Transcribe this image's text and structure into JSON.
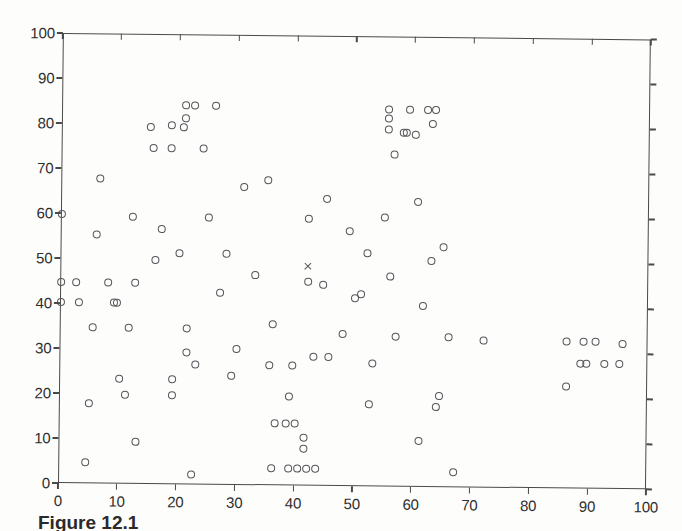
{
  "figure": {
    "caption_fragment": "Figure 12.1"
  },
  "chart_data": {
    "type": "scatter",
    "title": "",
    "subtitle": "",
    "xlabel": "",
    "ylabel": "",
    "xlim": [
      0,
      100
    ],
    "ylim": [
      0,
      100
    ],
    "xticks": [
      0,
      10,
      20,
      30,
      40,
      50,
      60,
      70,
      80,
      90,
      100
    ],
    "yticks": [
      0,
      10,
      20,
      30,
      40,
      50,
      60,
      70,
      80,
      90,
      100
    ],
    "xticklabels": [
      "0",
      "10",
      "20",
      "30",
      "40",
      "50",
      "60",
      "70",
      "80",
      "90",
      "100"
    ],
    "yticklabels": [
      "0",
      "10",
      "20",
      "30",
      "40",
      "50",
      "60",
      "70",
      "80",
      "90",
      "100"
    ],
    "grid": false,
    "legend": null,
    "legend_position": "none",
    "marker_color": "#55555a",
    "axis_color": "#4a4a4a",
    "background_color": "#ffffff",
    "series": [
      {
        "name": "data points",
        "marker": "circle-open",
        "points": [
          [
            0,
            45
          ],
          [
            0,
            40.5
          ],
          [
            0,
            60
          ],
          [
            2.5,
            45
          ],
          [
            3,
            40.5
          ],
          [
            4.5,
            5
          ],
          [
            5,
            18
          ],
          [
            5.5,
            35
          ],
          [
            6,
            55.5
          ],
          [
            6.5,
            68
          ],
          [
            8,
            45
          ],
          [
            9,
            40.5
          ],
          [
            9.5,
            40.5
          ],
          [
            10,
            23.5
          ],
          [
            11,
            20
          ],
          [
            11.5,
            35
          ],
          [
            12,
            59.5
          ],
          [
            12.5,
            45
          ],
          [
            13,
            9.5
          ],
          [
            15,
            79.5
          ],
          [
            15.5,
            75
          ],
          [
            16,
            50
          ],
          [
            17,
            57
          ],
          [
            18.5,
            75
          ],
          [
            18.5,
            80
          ],
          [
            19,
            20
          ],
          [
            19,
            23.5
          ],
          [
            20,
            51.5
          ],
          [
            20.5,
            79.5
          ],
          [
            21,
            81.5
          ],
          [
            21,
            84.5
          ],
          [
            21.5,
            29.5
          ],
          [
            21.5,
            35
          ],
          [
            22.5,
            84.5
          ],
          [
            22.5,
            2.5
          ],
          [
            23,
            27
          ],
          [
            24,
            75
          ],
          [
            25,
            59.5
          ],
          [
            26,
            84.5
          ],
          [
            27,
            43
          ],
          [
            28,
            51.5
          ],
          [
            29,
            24.5
          ],
          [
            30,
            30.5
          ],
          [
            31,
            66.5
          ],
          [
            33,
            47
          ],
          [
            35,
            68
          ],
          [
            35.5,
            27
          ],
          [
            36,
            36
          ],
          [
            36,
            4
          ],
          [
            36.5,
            14
          ],
          [
            38.5,
            14
          ],
          [
            40,
            14
          ],
          [
            39,
            20
          ],
          [
            39.5,
            27
          ],
          [
            39,
            4
          ],
          [
            40.5,
            4
          ],
          [
            42,
            4
          ],
          [
            43.5,
            4
          ],
          [
            41.5,
            11
          ],
          [
            41.5,
            8.5
          ],
          [
            42,
            59.5
          ],
          [
            42,
            45.5
          ],
          [
            43,
            29
          ],
          [
            44.5,
            45
          ],
          [
            45,
            64
          ],
          [
            45.5,
            29
          ],
          [
            48,
            34
          ],
          [
            49,
            57
          ],
          [
            50,
            42
          ],
          [
            51,
            43
          ],
          [
            52,
            52
          ],
          [
            52.5,
            18.5
          ],
          [
            53,
            27.5
          ],
          [
            55,
            60
          ],
          [
            55.5,
            82
          ],
          [
            55.5,
            79.5
          ],
          [
            55.5,
            84
          ],
          [
            56,
            47
          ],
          [
            56.5,
            74
          ],
          [
            57,
            33.5
          ],
          [
            58,
            79
          ],
          [
            58.5,
            79
          ],
          [
            59,
            84
          ],
          [
            60,
            78.5
          ],
          [
            60.5,
            63.5
          ],
          [
            61,
            10.5
          ],
          [
            61.5,
            40.5
          ],
          [
            62,
            84
          ],
          [
            63.5,
            84
          ],
          [
            63,
            81
          ],
          [
            63,
            50.5
          ],
          [
            64,
            18
          ],
          [
            64.5,
            20.5
          ],
          [
            65,
            53.5
          ],
          [
            66,
            33.5
          ],
          [
            67,
            3.5
          ],
          [
            72,
            33
          ],
          [
            86,
            23
          ],
          [
            86,
            33
          ],
          [
            88.5,
            28
          ],
          [
            89.5,
            28
          ],
          [
            89,
            33
          ],
          [
            91,
            33
          ],
          [
            92.5,
            28
          ],
          [
            95,
            28
          ],
          [
            95.5,
            32.5
          ]
        ]
      },
      {
        "name": "centroid",
        "marker": "x",
        "points": [
          [
            42,
            49
          ]
        ]
      }
    ]
  }
}
